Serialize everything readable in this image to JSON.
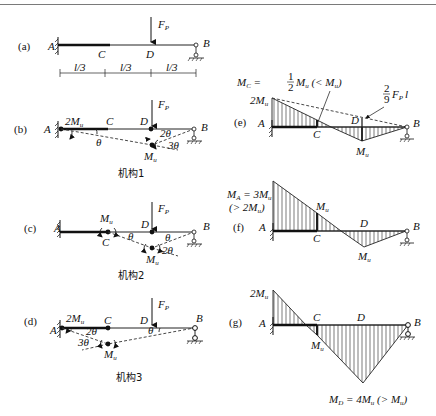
{
  "figure": {
    "panels": {
      "a": {
        "tag": "(a)",
        "labels": {
          "A": "A",
          "C": "C",
          "D": "D",
          "B": "B"
        },
        "load": "F",
        "load_sub": "P",
        "dims": [
          "l/3",
          "l/3",
          "l/3"
        ]
      },
      "b": {
        "tag": "(b)",
        "labels": {
          "A": "A",
          "C": "C",
          "D": "D",
          "B": "B"
        },
        "load": "F",
        "load_sub": "P",
        "moment_A": "2M",
        "moment_A_sub": "u",
        "moment_D": "M",
        "moment_D_sub": "u",
        "angle_A": "θ",
        "angle_B": "2θ",
        "angle_D": "3θ",
        "caption": "机构1"
      },
      "c": {
        "tag": "(c)",
        "labels": {
          "A": "A",
          "C": "C",
          "D": "D",
          "B": "B"
        },
        "load": "F",
        "load_sub": "P",
        "moment_C": "M",
        "moment_C_sub": "u",
        "moment_D": "M",
        "moment_D_sub": "u",
        "angle_C": "θ",
        "angle_B": "θ",
        "angle_D": "2θ",
        "caption": "机构2"
      },
      "d": {
        "tag": "(d)",
        "labels": {
          "A": "A",
          "C": "C",
          "D": "D",
          "B": "B"
        },
        "load": "F",
        "load_sub": "P",
        "moment_A": "2M",
        "moment_A_sub": "u",
        "moment_C": "M",
        "moment_C_sub": "u",
        "angle_A": "2θ",
        "angle_C": "3θ",
        "angle_B": "θ",
        "caption": "机构3"
      },
      "e": {
        "tag": "(e)",
        "labels": {
          "A": "A",
          "C": "C",
          "D": "D",
          "B": "B"
        },
        "top_left": "2M",
        "top_left_sub": "u",
        "mc_note_pre": "M",
        "mc_note_sub": "C",
        "mc_note_eq": " = ",
        "mc_frac_num": "1",
        "mc_frac_den": "2",
        "mc_note_post": "M",
        "mc_note_post_sub": "u",
        "mc_note_cmp": " (< M",
        "mc_note_cmp_sub": "u",
        "mc_note_close": ")",
        "fp_frac_num": "2",
        "fp_frac_den": "9",
        "fp_term": "F",
        "fp_term_sub": "P",
        "fp_term_l": "l",
        "bottom": "M",
        "bottom_sub": "u"
      },
      "f": {
        "tag": "(f)",
        "labels": {
          "A": "A",
          "C": "C",
          "D": "D",
          "B": "B"
        },
        "ma_line1": "M",
        "ma_line1_sub": "A",
        "ma_line1_rest": " = 3M",
        "ma_line1_rest_sub": "u",
        "ma_line2": "(> 2M",
        "ma_line2_sub": "u",
        "ma_line2_close": ")",
        "mc": "M",
        "mc_sub": "u",
        "bottom": "M",
        "bottom_sub": "u"
      },
      "g": {
        "tag": "(g)",
        "labels": {
          "A": "A",
          "C": "C",
          "D": "D",
          "B": "B"
        },
        "top_left": "2M",
        "top_left_sub": "u",
        "mc": "M",
        "mc_sub": "u",
        "md_note": "M",
        "md_note_sub": "D",
        "md_note_rest": " = 4M",
        "md_note_rest_sub": "u",
        "md_note_cmp": " (> M",
        "md_note_cmp_sub": "u",
        "md_note_close": ")"
      }
    }
  }
}
